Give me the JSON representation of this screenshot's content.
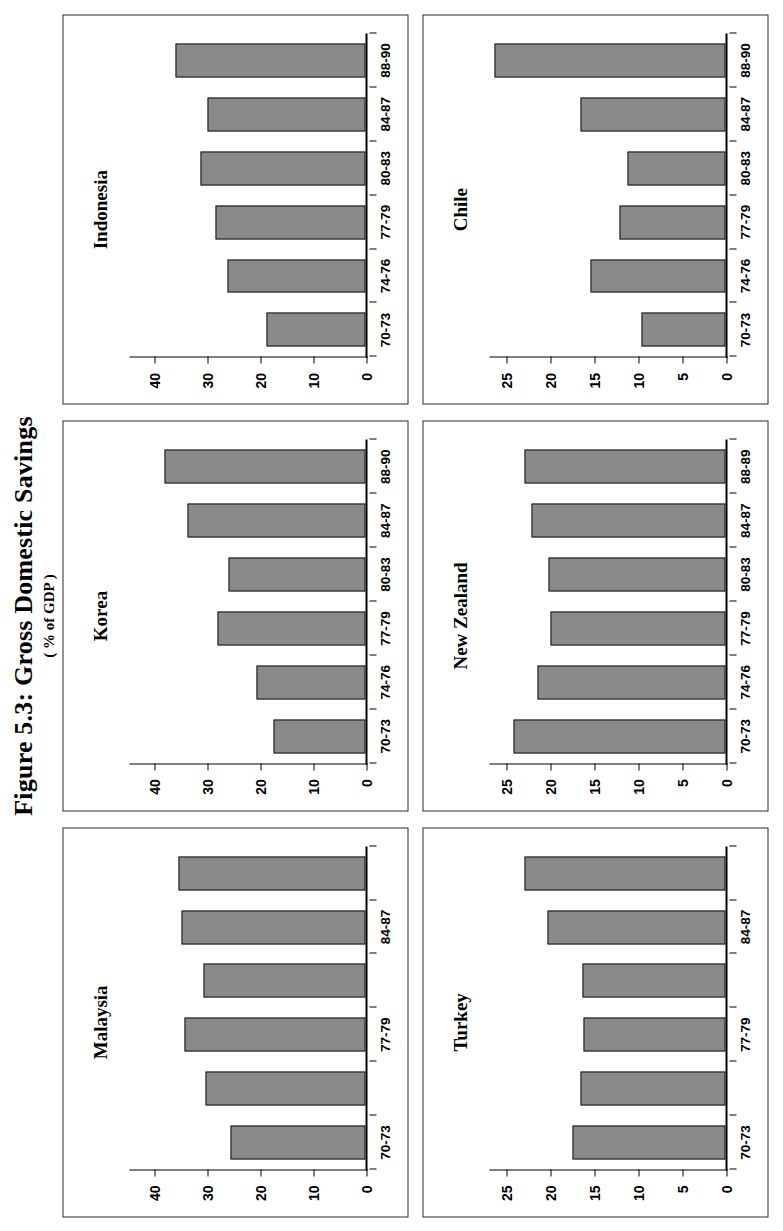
{
  "figure": {
    "title": "Figure 5.3: Gross Domestic Savings",
    "subtitle": "( % of GDP )"
  },
  "chart_data": [
    {
      "type": "bar",
      "title": "Malaysia",
      "categories": [
        "70-73",
        "74-76",
        "77-79",
        "80-83",
        "84-87",
        "88-90"
      ],
      "visible_tick_labels": [
        "70-73",
        "",
        "77-79",
        "",
        "84-87",
        ""
      ],
      "values": [
        25.8,
        30.6,
        34.6,
        30.9,
        35.0,
        35.6
      ],
      "xlabel": "",
      "ylabel": "",
      "ylim": [
        0,
        45
      ],
      "yticks": [
        0,
        10,
        20,
        30,
        40
      ],
      "ytick_labels": [
        "0",
        "10",
        "20",
        "30",
        "40"
      ],
      "grid": false
    },
    {
      "type": "bar",
      "title": "Korea",
      "categories": [
        "70-73",
        "74-76",
        "77-79",
        "80-83",
        "84-87",
        "88-90"
      ],
      "visible_tick_labels": [
        "70-73",
        "74-76",
        "77-79",
        "80-83",
        "84-87",
        "88-90"
      ],
      "values": [
        17.6,
        20.8,
        28.2,
        26.2,
        33.9,
        38.4
      ],
      "xlabel": "",
      "ylabel": "",
      "ylim": [
        0,
        45
      ],
      "yticks": [
        0,
        10,
        20,
        30,
        40
      ],
      "ytick_labels": [
        "0",
        "10",
        "20",
        "30",
        "40"
      ],
      "grid": false
    },
    {
      "type": "bar",
      "title": "Indonesia",
      "categories": [
        "70-73",
        "74-76",
        "77-79",
        "80-83",
        "84-87",
        "88-90"
      ],
      "visible_tick_labels": [
        "70-73",
        "74-76",
        "77-79",
        "80-83",
        "84-87",
        "88-90"
      ],
      "values": [
        18.9,
        26.4,
        28.6,
        31.4,
        30.1,
        36.3
      ],
      "xlabel": "",
      "ylabel": "",
      "ylim": [
        0,
        45
      ],
      "yticks": [
        0,
        10,
        20,
        30,
        40
      ],
      "ytick_labels": [
        "0",
        "10",
        "20",
        "30",
        "40"
      ],
      "grid": false
    },
    {
      "type": "bar",
      "title": "Turkey",
      "categories": [
        "70-73",
        "74-76",
        "77-79",
        "80-83",
        "84-87",
        "88-90"
      ],
      "visible_tick_labels": [
        "70-73",
        "",
        "77-79",
        "",
        "84-87",
        ""
      ],
      "values": [
        17.5,
        16.6,
        16.2,
        16.4,
        20.4,
        23.0
      ],
      "xlabel": "",
      "ylabel": "",
      "ylim": [
        0,
        27
      ],
      "yticks": [
        0,
        5,
        10,
        15,
        20,
        25
      ],
      "ytick_labels": [
        "0",
        "5",
        "10",
        "15",
        "20",
        "25"
      ],
      "grid": false
    },
    {
      "type": "bar",
      "title": "New Zealand",
      "categories": [
        "70-73",
        "74-76",
        "77-79",
        "80-83",
        "84-87",
        "88-89"
      ],
      "visible_tick_labels": [
        "70-73",
        "74-76",
        "77-79",
        "80-83",
        "84-87",
        "88-89"
      ],
      "values": [
        24.2,
        21.5,
        20.0,
        20.2,
        22.2,
        23.0
      ],
      "xlabel": "",
      "ylabel": "",
      "ylim": [
        0,
        27
      ],
      "yticks": [
        0,
        5,
        10,
        15,
        20,
        25
      ],
      "ytick_labels": [
        "0",
        "5",
        "10",
        "15",
        "20",
        "25"
      ],
      "grid": false
    },
    {
      "type": "bar",
      "title": "Chile",
      "categories": [
        "70-73",
        "74-76",
        "77-79",
        "80-83",
        "84-87",
        "88-90"
      ],
      "visible_tick_labels": [
        "70-73",
        "74-76",
        "77-79",
        "80-83",
        "84-87",
        "88-90"
      ],
      "values": [
        9.6,
        15.4,
        12.1,
        11.2,
        16.6,
        26.4
      ],
      "xlabel": "",
      "ylabel": "",
      "ylim": [
        0,
        27
      ],
      "yticks": [
        0,
        5,
        10,
        15,
        20,
        25
      ],
      "ytick_labels": [
        "0",
        "5",
        "10",
        "15",
        "20",
        "25"
      ],
      "grid": false
    }
  ],
  "style": {
    "bar_fill": "#8a8a8a",
    "bar_stroke": "#141414",
    "panel_border": "#2b2b2b",
    "text": "#000000"
  }
}
